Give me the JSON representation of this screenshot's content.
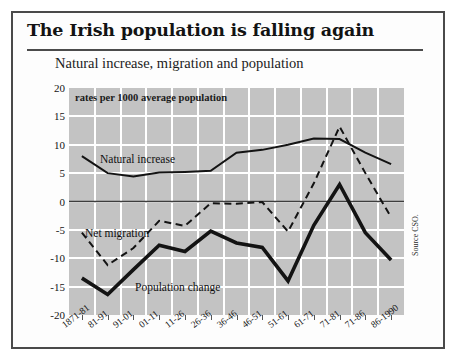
{
  "figure": {
    "title": "The Irish population is falling again",
    "subtitle": "Natural increase, migration and population",
    "units_note": "rates per 1000 average population",
    "source": "Source CSO."
  },
  "series_labels": {
    "natural": "Natural increase",
    "net_migration": "Net migration",
    "population": "Population change"
  },
  "chart_data": {
    "type": "line",
    "title": "Natural increase, migration and population",
    "subtitle": "rates per 1000 average population",
    "xlabel": "",
    "ylabel": "rates per 1000 average population",
    "ylim": [
      -20,
      20
    ],
    "yticks": [
      20,
      15,
      10,
      5,
      0,
      -5,
      -10,
      -15,
      -20
    ],
    "grid": true,
    "legend": "inline-annotations",
    "source": "Source CSO.",
    "categories": [
      "1871-81",
      "81-91",
      "91-01",
      "01-11",
      "11-26",
      "26-36",
      "36-46",
      "46-51",
      "51-61",
      "61-71",
      "71-81",
      "71-86",
      "86-1990"
    ],
    "series": [
      {
        "name": "Natural increase",
        "style": "solid",
        "values": [
          8.0,
          5.0,
          4.4,
          5.1,
          5.2,
          5.4,
          8.6,
          9.1,
          10.0,
          11.1,
          11.0,
          8.6,
          6.6
        ]
      },
      {
        "name": "Net migration",
        "style": "dashed",
        "values": [
          -5.5,
          -11.2,
          -8.2,
          -3.4,
          -4.3,
          -0.3,
          -0.4,
          -0.1,
          -5.3,
          3.2,
          13.2,
          5.0,
          -2.8
        ]
      },
      {
        "name": "Population change",
        "style": "solid-thick",
        "values": [
          -13.5,
          -16.4,
          -12.0,
          -7.7,
          -8.8,
          -5.2,
          -7.3,
          -8.1,
          -14.0,
          -4.2,
          3.0,
          -5.5,
          -10.3
        ]
      }
    ]
  }
}
